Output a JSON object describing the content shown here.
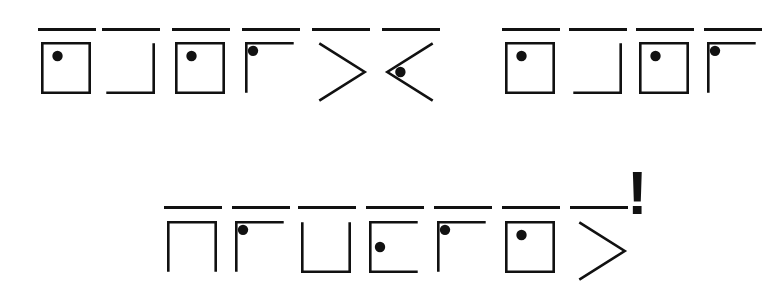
{
  "page": {
    "background_color": "#ffffff",
    "ink_color": "#111111",
    "width": 753,
    "height": 308,
    "stroke_width": 2.6,
    "dot_radius": 5.2,
    "overline_width": 3.2
  },
  "punctuation": {
    "exclamation": {
      "name": "exclamation-mark",
      "text": "!",
      "x": 627,
      "y": 162,
      "font_size": 62
    }
  },
  "lines": [
    {
      "name": "line-1",
      "baseline_y": 31,
      "symbol_top": 42,
      "groups": [
        {
          "name": "word-1",
          "symbols": [
            {
              "name": "symbol-square-dot",
              "shape": "square",
              "dot": true,
              "overline": true,
              "x": 41,
              "w": 50,
              "h": 52,
              "bar_x": 38,
              "bar_w": 58
            },
            {
              "name": "symbol-corner-bottom-right",
              "shape": "corner-br",
              "dot": false,
              "overline": true,
              "x": 105,
              "w": 50,
              "h": 52,
              "bar_x": 102,
              "bar_w": 58
            },
            {
              "name": "symbol-square-dot",
              "shape": "square",
              "dot": true,
              "overline": true,
              "x": 175,
              "w": 50,
              "h": 52,
              "bar_x": 172,
              "bar_w": 58
            },
            {
              "name": "symbol-corner-top-left-dot",
              "shape": "corner-tl",
              "dot": true,
              "overline": true,
              "x": 245,
              "w": 50,
              "h": 52,
              "bar_x": 242,
              "bar_w": 58
            },
            {
              "name": "symbol-chevron-right",
              "shape": "chevron-right",
              "dot": false,
              "overline": true,
              "x": 318,
              "w": 48,
              "h": 60,
              "bar_x": 312,
              "bar_w": 58
            },
            {
              "name": "symbol-chevron-left-dot",
              "shape": "chevron-left",
              "dot": true,
              "overline": true,
              "x": 386,
              "w": 48,
              "h": 60,
              "bar_x": 382,
              "bar_w": 58
            }
          ]
        },
        {
          "name": "word-2",
          "symbols": [
            {
              "name": "symbol-square-dot",
              "shape": "square",
              "dot": true,
              "overline": true,
              "x": 505,
              "w": 50,
              "h": 52,
              "bar_x": 502,
              "bar_w": 58
            },
            {
              "name": "symbol-corner-bottom-right",
              "shape": "corner-br",
              "dot": false,
              "overline": true,
              "x": 572,
              "w": 50,
              "h": 52,
              "bar_x": 569,
              "bar_w": 58
            },
            {
              "name": "symbol-square-dot",
              "shape": "square",
              "dot": true,
              "overline": true,
              "x": 639,
              "w": 50,
              "h": 52,
              "bar_x": 636,
              "bar_w": 58
            },
            {
              "name": "symbol-corner-top-left-dot",
              "shape": "corner-tl",
              "dot": true,
              "overline": true,
              "x": 707,
              "w": 50,
              "h": 52,
              "bar_x": 704,
              "bar_w": 58
            }
          ]
        }
      ]
    },
    {
      "name": "line-2",
      "baseline_y": 209,
      "symbol_top": 221,
      "groups": [
        {
          "name": "word-3",
          "symbols": [
            {
              "name": "symbol-arch-no-bottom",
              "shape": "arch",
              "dot": false,
              "overline": true,
              "x": 167,
              "w": 50,
              "h": 52,
              "bar_x": 164,
              "bar_w": 58
            },
            {
              "name": "symbol-corner-top-left-dot",
              "shape": "corner-tl",
              "dot": true,
              "overline": true,
              "x": 235,
              "w": 50,
              "h": 52,
              "bar_x": 232,
              "bar_w": 58
            },
            {
              "name": "symbol-cup-no-top",
              "shape": "cup",
              "dot": false,
              "overline": true,
              "x": 301,
              "w": 50,
              "h": 52,
              "bar_x": 298,
              "bar_w": 58
            },
            {
              "name": "symbol-bracket-left-dot",
              "shape": "bracket-left",
              "dot": true,
              "overline": true,
              "x": 369,
              "w": 50,
              "h": 52,
              "bar_x": 366,
              "bar_w": 58
            },
            {
              "name": "symbol-corner-top-left-dot",
              "shape": "corner-tl",
              "dot": true,
              "overline": true,
              "x": 437,
              "w": 50,
              "h": 52,
              "bar_x": 434,
              "bar_w": 58
            },
            {
              "name": "symbol-square-dot",
              "shape": "square",
              "dot": true,
              "overline": true,
              "x": 505,
              "w": 50,
              "h": 52,
              "bar_x": 502,
              "bar_w": 58
            },
            {
              "name": "symbol-chevron-right",
              "shape": "chevron-right",
              "dot": false,
              "overline": true,
              "x": 578,
              "w": 48,
              "h": 60,
              "bar_x": 570,
              "bar_w": 58
            }
          ]
        }
      ]
    }
  ]
}
